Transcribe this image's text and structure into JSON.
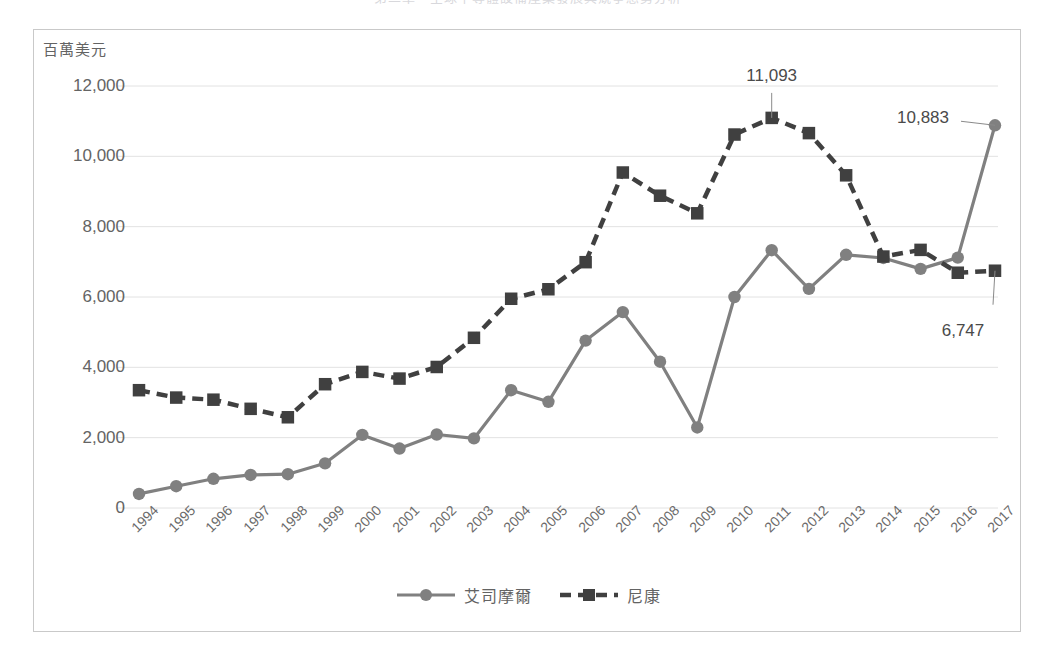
{
  "page": {
    "title_fragment": "第二章　全球半導體設備產業發展與競爭態勢分析"
  },
  "chart_data": {
    "type": "line",
    "title": "",
    "xlabel": "",
    "ylabel": "百萬美元",
    "ylim": [
      0,
      12000
    ],
    "ytick_step": 2000,
    "grid": true,
    "legend_position": "bottom",
    "yticks": [
      "0",
      "2,000",
      "4,000",
      "6,000",
      "8,000",
      "10,000",
      "12,000"
    ],
    "categories": [
      "1994",
      "1995",
      "1996",
      "1997",
      "1998",
      "1999",
      "2000",
      "2001",
      "2002",
      "2003",
      "2004",
      "2005",
      "2006",
      "2007",
      "2008",
      "2009",
      "2010",
      "2011",
      "2012",
      "2013",
      "2014",
      "2015",
      "2016",
      "2017"
    ],
    "series": [
      {
        "name": "艾司摩爾",
        "marker": "circle",
        "line_style": "solid",
        "color": "#808080",
        "values": [
          400,
          620,
          830,
          940,
          960,
          1270,
          2080,
          1690,
          2090,
          1980,
          3350,
          3020,
          4760,
          5570,
          4160,
          2290,
          6000,
          7330,
          6230,
          7200,
          7110,
          6800,
          7120,
          10883
        ]
      },
      {
        "name": "尼康",
        "marker": "square",
        "line_style": "dashed",
        "color": "#404040",
        "values": [
          3350,
          3140,
          3080,
          2820,
          2580,
          3520,
          3870,
          3680,
          4010,
          4840,
          5950,
          6220,
          6990,
          9540,
          8880,
          8380,
          10620,
          11093,
          10660,
          9460,
          7150,
          7340,
          6690,
          6747
        ]
      }
    ],
    "annotations": [
      {
        "text": "11,093",
        "series": "尼康",
        "category": "2011",
        "value": 11093
      },
      {
        "text": "10,883",
        "series": "艾司摩爾",
        "category": "2017",
        "value": 10883
      },
      {
        "text": "6,747",
        "series": "尼康",
        "category": "2017",
        "value": 6747
      }
    ],
    "colors": {
      "asml": "#808080",
      "nikon": "#404040",
      "grid": "#e2e2e2",
      "frame": "#c9c9c9",
      "text": "#646464"
    }
  }
}
